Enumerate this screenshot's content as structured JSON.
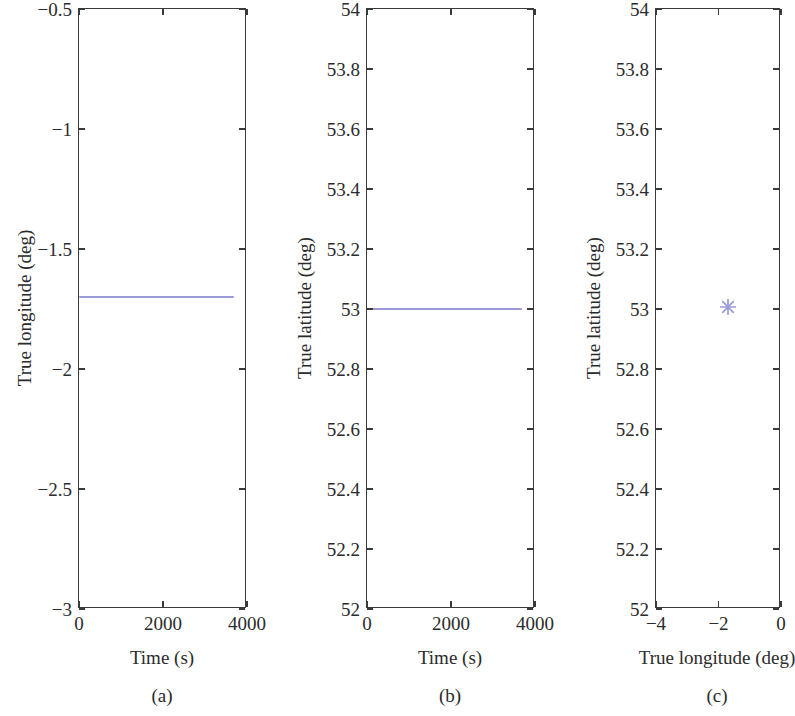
{
  "figure": {
    "background": "#ffffff",
    "series_color": "#9a9ad8",
    "axis_color": "#3a3a3a"
  },
  "panels": [
    {
      "caption": "(a)",
      "xlabel": "Time (s)",
      "ylabel": "True longitude (deg)",
      "xticks": [
        "0",
        "2000",
        "4000"
      ],
      "xtick_values": [
        0,
        2000,
        4000
      ],
      "yticks": [
        "−3",
        "−2.5",
        "−2",
        "−1.5",
        "−1",
        "−0.5"
      ],
      "ytick_values": [
        -3,
        -2.5,
        -2,
        -1.5,
        -1,
        -0.5
      ]
    },
    {
      "caption": "(b)",
      "xlabel": "Time (s)",
      "ylabel": "True latitude (deg)",
      "xticks": [
        "0",
        "2000",
        "4000"
      ],
      "xtick_values": [
        0,
        2000,
        4000
      ],
      "yticks": [
        "52",
        "52.2",
        "52.4",
        "52.6",
        "52.8",
        "53",
        "53.2",
        "53.4",
        "53.6",
        "53.8",
        "54"
      ],
      "ytick_values": [
        52,
        52.2,
        52.4,
        52.6,
        52.8,
        53,
        53.2,
        53.4,
        53.6,
        53.8,
        54
      ]
    },
    {
      "caption": "(c)",
      "xlabel": "True longitude (deg)",
      "ylabel": "True latitude (deg)",
      "xticks": [
        "−4",
        "−2",
        "0"
      ],
      "xtick_values": [
        -4,
        -2,
        0
      ],
      "yticks": [
        "52",
        "52.2",
        "52.4",
        "52.6",
        "52.8",
        "53",
        "53.2",
        "53.4",
        "53.6",
        "53.8",
        "54"
      ],
      "ytick_values": [
        52,
        52.2,
        52.4,
        52.6,
        52.8,
        53,
        53.2,
        53.4,
        53.6,
        53.8,
        54
      ]
    }
  ],
  "chart_data": [
    {
      "type": "line",
      "panel": "(a)",
      "title": "",
      "xlabel": "Time (s)",
      "ylabel": "True longitude (deg)",
      "xlim": [
        0,
        4000
      ],
      "ylim": [
        -3,
        -0.5
      ],
      "xticks": [
        0,
        2000,
        4000
      ],
      "yticks": [
        -3,
        -2.5,
        -2,
        -1.5,
        -1,
        -0.5
      ],
      "grid": false,
      "legend": null,
      "series": [
        {
          "name": "True longitude",
          "color": "#9a9ad8",
          "x": [
            0,
            500,
            1000,
            1500,
            2000,
            2500,
            3000,
            3500,
            3700
          ],
          "values": [
            -1.7,
            -1.7,
            -1.7,
            -1.7,
            -1.7,
            -1.7,
            -1.7,
            -1.7,
            -1.7
          ]
        }
      ]
    },
    {
      "type": "line",
      "panel": "(b)",
      "title": "",
      "xlabel": "Time (s)",
      "ylabel": "True latitude (deg)",
      "xlim": [
        0,
        4000
      ],
      "ylim": [
        52,
        54
      ],
      "xticks": [
        0,
        2000,
        4000
      ],
      "yticks": [
        52,
        52.2,
        52.4,
        52.6,
        52.8,
        53,
        53.2,
        53.4,
        53.6,
        53.8,
        54
      ],
      "grid": false,
      "legend": null,
      "series": [
        {
          "name": "True latitude",
          "color": "#9a9ad8",
          "x": [
            0,
            500,
            1000,
            1500,
            2000,
            2500,
            3000,
            3500,
            3700
          ],
          "values": [
            53,
            53,
            53,
            53,
            53,
            53,
            53,
            53,
            53
          ]
        }
      ]
    },
    {
      "type": "scatter",
      "panel": "(c)",
      "title": "",
      "xlabel": "True longitude (deg)",
      "ylabel": "True latitude (deg)",
      "xlim": [
        -4,
        0
      ],
      "ylim": [
        52,
        54
      ],
      "xticks": [
        -4,
        -2,
        0
      ],
      "yticks": [
        52,
        52.2,
        52.4,
        52.6,
        52.8,
        53,
        53.2,
        53.4,
        53.6,
        53.8,
        54
      ],
      "grid": false,
      "legend": null,
      "marker": "asterisk",
      "series": [
        {
          "name": "True position",
          "color": "#9a9ad8",
          "x": [
            -1.7
          ],
          "values": [
            53
          ]
        }
      ]
    }
  ]
}
